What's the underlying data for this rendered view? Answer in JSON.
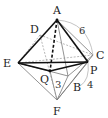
{
  "figure": {
    "type": "octahedron-diagram",
    "points": {
      "A": {
        "label": "A",
        "x": 57,
        "y": 20
      },
      "C": {
        "label": "C",
        "x": 93,
        "y": 55
      },
      "E": {
        "label": "E",
        "x": 18,
        "y": 63
      },
      "P": {
        "label": "P",
        "x": 88,
        "y": 62
      },
      "Q": {
        "label": "Q",
        "x": 50,
        "y": 71
      },
      "B": {
        "label": "B",
        "x": 68,
        "y": 76
      },
      "F": {
        "label": "F",
        "x": 57,
        "y": 100
      },
      "D": {
        "label": "D",
        "x": 40,
        "y": 35
      }
    },
    "measures": {
      "AC": "6",
      "QF": "3",
      "PF": "4"
    },
    "colors": {
      "bold_edge": "#111111",
      "thin_edge": "#777777",
      "hidden_edge": "#999999",
      "arc": "#aaaaaa"
    }
  }
}
